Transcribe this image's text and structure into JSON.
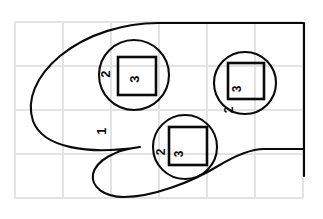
{
  "figure": {
    "background_color": "#ffffff",
    "stroke_color": "#0a0a0a",
    "grid_color": "#e3e3e3",
    "width": 323,
    "height": 219,
    "label_rotation_degrees": -90
  },
  "grid": {
    "visible": true,
    "origin_x": 15,
    "origin_y": 22,
    "cell_width": 48,
    "cell_height": 44,
    "columns": 6,
    "rows": 4,
    "vertical_lines": [
      15,
      63,
      111,
      159,
      207,
      255,
      303
    ],
    "horizontal_lines": [
      22,
      66,
      110,
      154,
      198
    ]
  },
  "shapes": {
    "outer_region": {
      "name": "outer-region",
      "label": "1",
      "label_x": 103,
      "label_y": 131,
      "path": "M 304 23 L 150 23 C 120 23 86 34 58 58 C 34 79 26 102 34 122 C 44 146 86 154 138 147 C 112 150 96 160 93 172 C 90 185 102 196 122 197 C 150 198 190 184 216 168 C 236 156 250 150 262 149 L 304 149 L 304 176 L 304 23 Z"
    },
    "circles": [
      {
        "name": "circle-top-left",
        "cx": 134,
        "cy": 75,
        "r": 35,
        "outer_label": "2",
        "outer_label_x": 107,
        "outer_label_y": 74,
        "square": {
          "x": 118,
          "y": 57,
          "width": 38,
          "height": 38,
          "label": "3",
          "label_x": 136,
          "label_y": 79
        }
      },
      {
        "name": "circle-right",
        "cx": 245,
        "cy": 83,
        "r": 31,
        "outer_label": "2",
        "outer_label_x": 230,
        "outer_label_y": 109,
        "square": {
          "x": 228,
          "y": 63,
          "width": 36,
          "height": 36,
          "label": "3",
          "label_x": 238,
          "label_y": 88
        }
      },
      {
        "name": "circle-bottom-center",
        "cx": 185,
        "cy": 147,
        "r": 32,
        "outer_label": "2",
        "outer_label_x": 162,
        "outer_label_y": 152,
        "square": {
          "x": 169,
          "y": 127,
          "width": 38,
          "height": 38,
          "label": "3",
          "label_x": 180,
          "label_y": 154
        }
      }
    ]
  },
  "labels": {
    "depth_1": "1",
    "depth_2": "2",
    "depth_3": "3"
  }
}
